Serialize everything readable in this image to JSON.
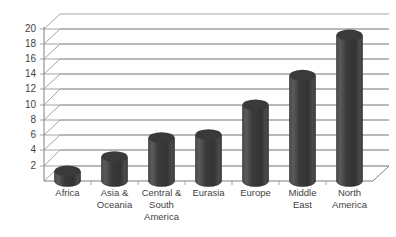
{
  "chart_data": {
    "type": "bar",
    "title": "",
    "subtitle": "",
    "xlabel": "",
    "ylabel": "",
    "categories": [
      "Africa",
      "Asia & Oceania",
      "Central & South America",
      "Eurasia",
      "Europe",
      "Middle East",
      "North America"
    ],
    "values": [
      1.3,
      3.2,
      5.7,
      6.1,
      10.0,
      13.9,
      19.2
    ],
    "ylim": [
      0,
      20
    ],
    "ytick_values": [
      2,
      4,
      6,
      8,
      10,
      12,
      14,
      16,
      18,
      20
    ],
    "ytick_labels": [
      "2",
      "4",
      "6",
      "8",
      "10",
      "12",
      "14",
      "16",
      "18",
      "20"
    ],
    "grid": true,
    "legend": "none",
    "style": "3d-cylinder",
    "bar_color": "#3f3f3f",
    "grid_color": "#9a9a9a",
    "background_color": "#ffffff"
  },
  "axis": {
    "y": {
      "labels": [
        "20",
        "18",
        "16",
        "14",
        "12",
        "10",
        "8",
        "6",
        "4",
        "2"
      ]
    },
    "x": {
      "labels": [
        {
          "line1": "Africa",
          "line2": "",
          "line3": ""
        },
        {
          "line1": "Asia &",
          "line2": "Oceania",
          "line3": ""
        },
        {
          "line1": "Central &",
          "line2": "South",
          "line3": "America"
        },
        {
          "line1": "Eurasia",
          "line2": "",
          "line3": ""
        },
        {
          "line1": "Europe",
          "line2": "",
          "line3": ""
        },
        {
          "line1": "Middle",
          "line2": "East",
          "line3": ""
        },
        {
          "line1": "North",
          "line2": "America",
          "line3": ""
        }
      ]
    }
  }
}
